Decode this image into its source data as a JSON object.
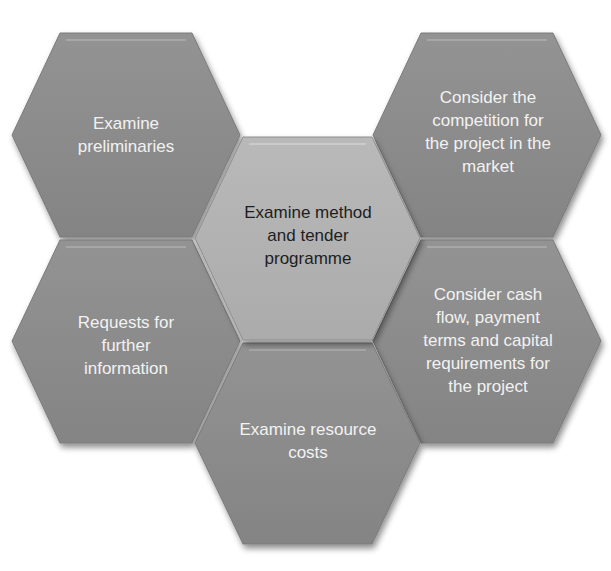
{
  "diagram": {
    "type": "hexagon-cluster",
    "colors": {
      "outer_fill": "#8c8c8c",
      "outer_fill_dark": "#7c7c7c",
      "center_fill": "#b3b3b3",
      "outer_text": "#f2f2f2",
      "center_text": "#1e1e1e",
      "background": "#ffffff"
    },
    "hexagons": [
      {
        "id": "top-left",
        "text": "Examine\npreliminaries",
        "style": "outer"
      },
      {
        "id": "top-right",
        "text": "Consider the\ncompetition for\nthe project in the\nmarket",
        "style": "outer"
      },
      {
        "id": "mid-left",
        "text": "Requests for\nfurther\ninformation",
        "style": "outer"
      },
      {
        "id": "center",
        "text": "Examine method\nand tender\nprogramme",
        "style": "center"
      },
      {
        "id": "mid-right",
        "text": "Consider cash\nflow, payment\nterms and capital\nrequirements for\nthe project",
        "style": "outer"
      },
      {
        "id": "bottom-center",
        "text": "Examine resource\ncosts",
        "style": "outer"
      }
    ]
  }
}
